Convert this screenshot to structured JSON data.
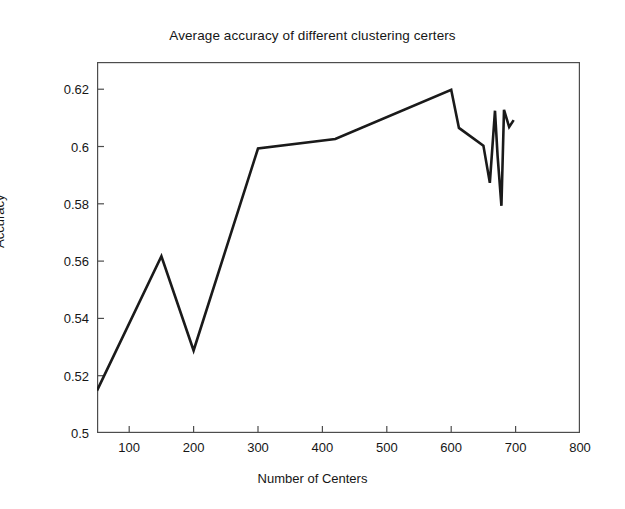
{
  "chart_data": {
    "type": "line",
    "title": "Average accuracy of different clustering certers",
    "xlabel": "Number of Centers",
    "ylabel": "Accuracy",
    "xlim": [
      50,
      800
    ],
    "ylim": [
      0.5,
      0.6295
    ],
    "grid": false,
    "legend": null,
    "xticks": [
      100,
      200,
      300,
      400,
      500,
      600,
      700,
      800
    ],
    "xtick_labels": [
      "100",
      "200",
      "300",
      "400",
      "500",
      "600",
      "700",
      "800"
    ],
    "yticks": [
      0.5,
      0.52,
      0.54,
      0.56,
      0.58,
      0.6,
      0.62
    ],
    "ytick_labels": [
      "0.5",
      "0.52",
      "0.54",
      "0.56",
      "0.58",
      "0.6",
      "0.62"
    ],
    "series": [
      {
        "name": "Average accuracy",
        "color": "#1a1a1a",
        "line_width": 2.6,
        "x": [
          50,
          150,
          200,
          300,
          420,
          600,
          612,
          650,
          660,
          668,
          672,
          678,
          682,
          690,
          697
        ],
        "y": [
          0.5148,
          0.5617,
          0.5288,
          0.5993,
          0.6026,
          0.6198,
          0.6065,
          0.6003,
          0.5873,
          0.6125,
          0.5968,
          0.5793,
          0.6128,
          0.6068,
          0.6092
        ]
      }
    ]
  },
  "axes": {
    "y_label": "Accuracy",
    "x_label": "Number of Centers"
  }
}
